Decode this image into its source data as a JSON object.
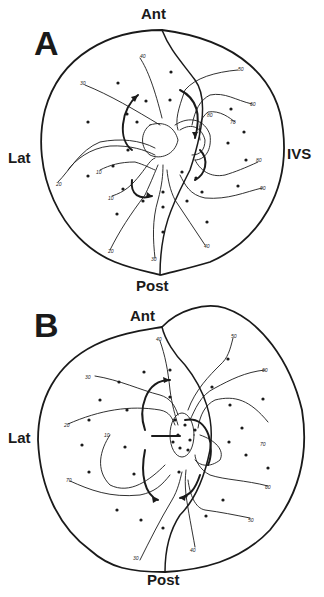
{
  "figure": {
    "panels": [
      {
        "id": "A",
        "label": "A",
        "orientation": {
          "top": "Ant",
          "bottom": "Post",
          "left": "Lat",
          "right": "IVS"
        },
        "contour_labels": [
          "40",
          "30",
          "50",
          "60",
          "70",
          "80",
          "80",
          "90",
          "20",
          "10",
          "10",
          "20",
          "30",
          "40"
        ]
      },
      {
        "id": "B",
        "label": "B",
        "orientation": {
          "top": "Ant",
          "bottom": "Post",
          "left": "Lat"
        },
        "contour_labels": [
          "40",
          "50",
          "60",
          "30",
          "20",
          "10",
          "70",
          "70",
          "60",
          "50",
          "30",
          "40"
        ]
      }
    ]
  }
}
